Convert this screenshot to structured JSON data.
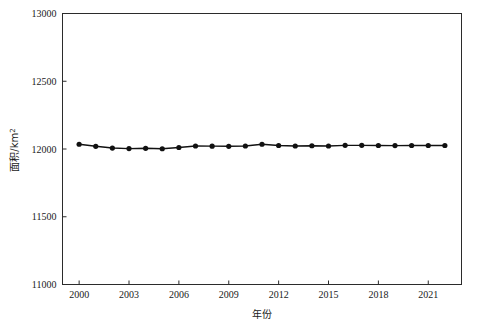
{
  "chart_data": {
    "type": "line",
    "title": "",
    "subtitle": "",
    "xlabel": "年份",
    "ylabel": "面积/km²",
    "ylabel_text": "面积/km",
    "ylabel_superscript": "2",
    "xlim": [
      1999,
      2023
    ],
    "ylim": [
      11000,
      13000
    ],
    "grid": false,
    "legend": null,
    "legend_position": "none",
    "x_ticks": [
      2000,
      2003,
      2006,
      2009,
      2012,
      2015,
      2018,
      2021
    ],
    "x_tick_labels": [
      "2000",
      "2003",
      "2006",
      "2009",
      "2012",
      "2015",
      "2018",
      "2021"
    ],
    "y_ticks": [
      11000,
      11500,
      12000,
      12500,
      13000
    ],
    "y_tick_labels": [
      "11000",
      "11500",
      "12000",
      "12500",
      "13000"
    ],
    "marker": "circle",
    "marker_color": "#111111",
    "line_color": "#111111",
    "x": [
      2000,
      2001,
      2002,
      2003,
      2004,
      2005,
      2006,
      2007,
      2008,
      2009,
      2010,
      2011,
      2012,
      2013,
      2014,
      2015,
      2016,
      2017,
      2018,
      2019,
      2020,
      2021,
      2022
    ],
    "categories": [
      "2000",
      "2001",
      "2002",
      "2003",
      "2004",
      "2005",
      "2006",
      "2007",
      "2008",
      "2009",
      "2010",
      "2011",
      "2012",
      "2013",
      "2014",
      "2015",
      "2016",
      "2017",
      "2018",
      "2019",
      "2020",
      "2021",
      "2022"
    ],
    "values": [
      12035,
      12020,
      12007,
      12003,
      12005,
      12002,
      12011,
      12022,
      12021,
      12020,
      12022,
      12035,
      12026,
      12022,
      12024,
      12022,
      12027,
      12027,
      12026,
      12025,
      12026,
      12026,
      12026
    ],
    "series": [
      {
        "name": "面积",
        "values": [
          12035,
          12020,
          12007,
          12003,
          12005,
          12002,
          12011,
          12022,
          12021,
          12020,
          12022,
          12035,
          12026,
          12022,
          12024,
          12022,
          12027,
          12027,
          12026,
          12025,
          12026,
          12026,
          12026
        ]
      }
    ]
  }
}
